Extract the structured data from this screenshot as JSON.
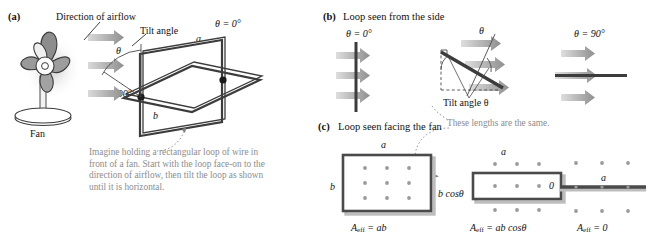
{
  "figure": {
    "panels": [
      {
        "letter": "(a)",
        "title": ""
      },
      {
        "letter": "(b)",
        "title": "Loop seen from the side"
      },
      {
        "letter": "(c)",
        "title": "Loop seen facing the fan"
      }
    ]
  },
  "panel_a": {
    "airflow_label": "Direction of airflow",
    "tilt_angle_label": "Tilt angle",
    "theta_symbol": "θ",
    "theta_zero": "θ = 0°",
    "theta_ninety": "θ = 90°",
    "side_a": "a",
    "side_b": "b",
    "fan_label": "Fan",
    "caption": "Imagine holding a rectangular loop of wire in front of a fan. Start with the loop face-on to the direction of airflow, then tilt the loop as shown until it is horizontal.",
    "arrow_color": "#9a9a9a"
  },
  "panel_b": {
    "letter": "(b)",
    "title": "Loop seen from the side",
    "left": {
      "theta": "θ = 0°"
    },
    "middle": {
      "theta": "θ",
      "tilt_label": "Tilt angle θ"
    },
    "right": {
      "theta": "θ = 90°"
    },
    "note": "These lengths are the same.",
    "loop_color": "#3c3c3c",
    "arrow_color": "#9a9a9a"
  },
  "panel_c": {
    "letter": "(c)",
    "title": "Loop seen facing the fan",
    "items": [
      {
        "top_label": "a",
        "side_label": "b",
        "formula_lhs": "A",
        "formula_sub": "eff",
        "formula_rhs": "= ab"
      },
      {
        "top_label": "a",
        "side_label": "b cosθ",
        "formula_lhs": "A",
        "formula_sub": "eff",
        "formula_rhs": "= ab cosθ"
      },
      {
        "top_label": "a",
        "side_label": "0",
        "formula_lhs": "A",
        "formula_sub": "eff",
        "formula_rhs": "= 0"
      }
    ],
    "dot_color": "#9a9a9a",
    "rect_border": "#4a4a4a"
  },
  "colors": {
    "ink": "#1b1b1b",
    "gray_text": "#8d8d8d",
    "arrow_gray": "#9a9a9a",
    "loop_dark": "#3c3c3c",
    "fan_blade": "#8a8a8a"
  }
}
